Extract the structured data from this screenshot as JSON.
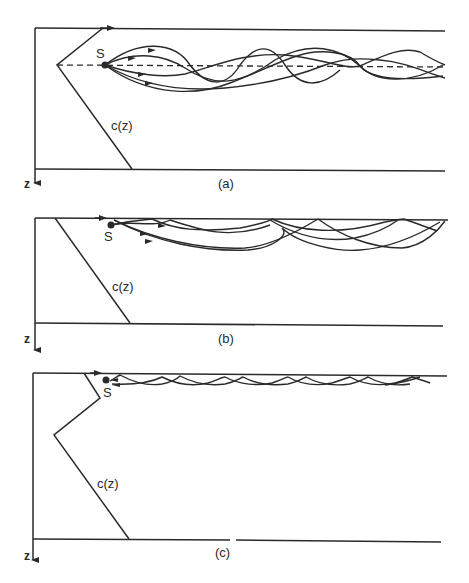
{
  "figure": {
    "panels": [
      {
        "id": "a",
        "label": "(a)",
        "source_label": "S",
        "profile_label": "c(z)",
        "axis_label": "z",
        "description": "Source at sound-speed minimum (channel axis); rays oscillate about dashed axis"
      },
      {
        "id": "b",
        "label": "(b)",
        "source_label": "S",
        "profile_label": "c(z)",
        "axis_label": "z",
        "description": "Source near surface with increasing sound speed; rays refract and reflect at surface"
      },
      {
        "id": "c",
        "label": "(c)",
        "source_label": "S",
        "profile_label": "c(z)",
        "axis_label": "z",
        "description": "Surface duct; rays trapped in thin near-surface layer"
      }
    ]
  }
}
